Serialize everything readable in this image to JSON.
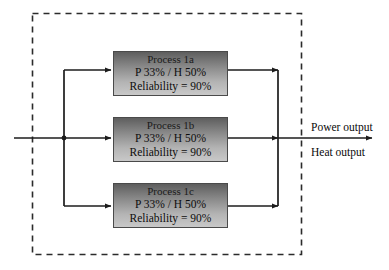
{
  "diagram": {
    "boundary": {
      "name": "system-boundary",
      "style": "dashed",
      "color": "#2b2b2b"
    },
    "input": {
      "name": "input-flow-arrow",
      "label": ""
    },
    "processes": [
      {
        "id": "process-1a",
        "title": "Process 1a",
        "spec": "P 33% / H 50%",
        "reliability": "Reliability = 90%",
        "power_percent": 33,
        "heat_percent": 50,
        "reliability_percent": 90
      },
      {
        "id": "process-1b",
        "title": "Process 1b",
        "spec": "P 33% / H 50%",
        "reliability": "Reliability = 90%",
        "power_percent": 33,
        "heat_percent": 50,
        "reliability_percent": 90
      },
      {
        "id": "process-1c",
        "title": "Process 1c",
        "spec": "P 33% / H 50%",
        "reliability": "Reliability = 90%",
        "power_percent": 33,
        "heat_percent": 50,
        "reliability_percent": 90
      }
    ],
    "outputs": [
      {
        "id": "power-output",
        "label": "Power output"
      },
      {
        "id": "heat-output",
        "label": "Heat output"
      }
    ],
    "colors": {
      "line": "#1c1c1c",
      "boundary": "#2b2b2b",
      "box_border": "#4a4a4a",
      "box_gradient_top": "#5e5e5e",
      "box_gradient_bottom": "#c8c8c8",
      "text": "#0d0d0d"
    }
  }
}
